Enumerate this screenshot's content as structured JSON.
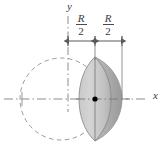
{
  "figure": {
    "axes": {
      "x_label": "x",
      "y_label": "y",
      "style": "dash-dot",
      "color": "#8c8c8c"
    },
    "labels": {
      "dim_left": {
        "numerator": "R",
        "denominator": "2"
      },
      "dim_right": {
        "numerator": "R",
        "denominator": "2"
      }
    },
    "dimensions": [
      {
        "name": "left-segment",
        "text": "R/2",
        "from_x": 68,
        "to_x": 95,
        "y": 41
      },
      {
        "name": "right-segment",
        "text": "R/2",
        "from_x": 95,
        "to_x": 122,
        "y": 41
      }
    ],
    "circle": {
      "cx": 61,
      "cy": 99,
      "r": 41,
      "dashed": true,
      "stroke": "#9a9a9a"
    },
    "lens": {
      "apex_top_y": 57,
      "apex_bottom_y": 141,
      "left_x": 79,
      "right_x": 122,
      "center_x": 95
    },
    "origin_dot": {
      "cx": 95,
      "cy": 99,
      "r": 2.6,
      "color": "#000000"
    },
    "colors": {
      "solid_light": "#d2d2d2",
      "solid_mid": "#b9b9b9",
      "solid_dark": "#9e9e9e",
      "axis": "#8c8c8c",
      "dimension_line": "#5a5a5a",
      "text": "#3a3a3a",
      "background": "#ffffff"
    }
  }
}
